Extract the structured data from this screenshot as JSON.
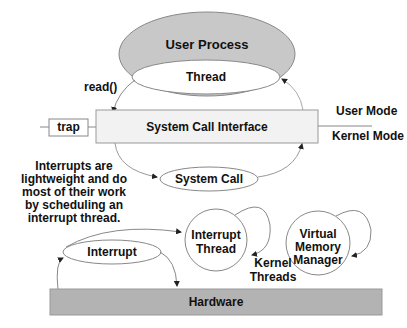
{
  "diagram": {
    "user_process": {
      "label": "User Process",
      "fill": "#c8c8c8"
    },
    "thread": {
      "label": "Thread"
    },
    "read_call": {
      "label": "read()"
    },
    "trap": {
      "label": "trap"
    },
    "system_call_interface": {
      "label": "System Call Interface",
      "fill": "#f2f2f2"
    },
    "modes": {
      "user": "User Mode",
      "kernel": "Kernel Mode"
    },
    "system_call": {
      "label": "System Call"
    },
    "note": {
      "text": "Interrupts are lightweight and do most of their work by scheduling an interrupt thread."
    },
    "interrupt_thread": {
      "label": "Interrupt Thread"
    },
    "vmm": {
      "label": "Virtual Memory Manager"
    },
    "kernel_threads": {
      "label": "Kernel Threads"
    },
    "interrupt": {
      "label": "Interrupt"
    },
    "hardware": {
      "label": "Hardware",
      "fill": "#b3b3b3"
    }
  }
}
